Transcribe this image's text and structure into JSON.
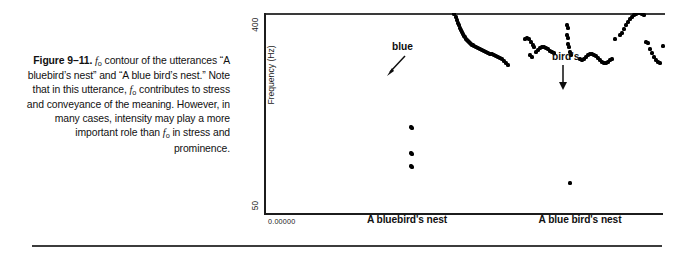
{
  "caption": {
    "figure_label": "Figure 9–11.",
    "text_part_1": " contour of the utterances “A bluebird’s nest” and “A blue bird’s nest.” Note that in this utterance, ",
    "text_part_2": " contributes to stress and conveyance of the meaning. However, in many cases, intensity may play a more important role than ",
    "text_part_3": " in stress and prominence.",
    "symbol": "f",
    "symbol_sub": "o"
  },
  "chart_data": {
    "type": "scatter",
    "title": "",
    "xlabel": "",
    "ylabel": "Frequency (Hz)",
    "ylim": [
      50,
      400
    ],
    "yticks": [
      50,
      400
    ],
    "ytick_labels": [
      "50",
      "400"
    ],
    "y_scale": "logarithmic",
    "grid": false,
    "legend": false,
    "x_origin_label": "0.00000",
    "xtick_labels": [
      "A bluebird's nest",
      "A blue bird's nest"
    ],
    "annotations": [
      {
        "label": "blue",
        "arrow": "diagonal-down-left"
      },
      {
        "label": "bird's",
        "arrow": "vertical-down"
      }
    ],
    "series": [
      {
        "name": "A bluebird's nest",
        "points": [
          [
            101,
            228
          ],
          [
            103,
            228
          ],
          [
            105,
            227
          ],
          [
            107,
            226
          ],
          [
            109,
            226
          ],
          [
            111,
            227
          ],
          [
            113,
            227
          ],
          [
            126,
            232
          ],
          [
            128,
            233
          ],
          [
            130,
            232
          ],
          [
            131,
            230
          ],
          [
            133,
            236
          ],
          [
            135,
            240
          ],
          [
            136,
            243
          ],
          [
            139,
            262
          ],
          [
            141,
            268
          ],
          [
            142,
            272
          ],
          [
            144,
            276
          ],
          [
            146,
            279
          ],
          [
            147,
            281
          ],
          [
            149,
            284
          ],
          [
            151,
            286
          ],
          [
            152,
            287
          ],
          [
            146,
            253
          ],
          [
            148,
            252
          ],
          [
            152,
            258
          ],
          [
            154,
            259
          ],
          [
            156,
            288
          ],
          [
            158,
            287
          ],
          [
            160,
            285
          ],
          [
            157,
            246
          ],
          [
            159,
            245
          ],
          [
            161,
            244
          ],
          [
            163,
            243
          ],
          [
            165,
            242
          ],
          [
            167,
            241
          ],
          [
            168,
            241
          ],
          [
            163,
            262
          ],
          [
            165,
            259
          ],
          [
            166,
            256
          ],
          [
            170,
            239
          ],
          [
            172,
            237
          ],
          [
            173,
            236
          ],
          [
            175,
            233
          ],
          [
            177,
            230
          ],
          [
            178,
            228
          ],
          [
            180,
            224
          ],
          [
            182,
            220
          ],
          [
            183,
            217
          ],
          [
            185,
            213
          ],
          [
            186,
            210
          ],
          [
            188,
            207
          ],
          [
            189,
            204
          ],
          [
            190,
            201
          ],
          [
            192,
            198
          ],
          [
            193,
            195
          ],
          [
            194,
            192
          ],
          [
            195,
            190
          ],
          [
            196,
            187
          ],
          [
            197,
            185
          ],
          [
            198,
            183
          ],
          [
            199,
            181
          ],
          [
            200,
            179
          ],
          [
            201,
            178
          ],
          [
            202,
            176
          ],
          [
            203,
            175
          ],
          [
            204,
            174
          ],
          [
            205,
            173
          ],
          [
            206,
            172
          ],
          [
            207,
            171
          ],
          [
            208,
            170
          ],
          [
            209,
            170
          ],
          [
            210,
            169
          ],
          [
            212,
            168
          ],
          [
            214,
            167
          ],
          [
            216,
            166
          ],
          [
            218,
            165
          ],
          [
            220,
            164
          ],
          [
            222,
            163
          ],
          [
            224,
            162
          ],
          [
            226,
            161
          ],
          [
            228,
            161
          ],
          [
            230,
            160
          ],
          [
            232,
            159
          ],
          [
            234,
            158
          ],
          [
            236,
            157
          ],
          [
            238,
            156
          ],
          [
            240,
            154
          ],
          [
            242,
            152
          ],
          [
            244,
            150
          ],
          [
            147,
            88
          ],
          [
            148,
            87
          ],
          [
            147,
            62
          ],
          [
            148,
            61
          ],
          [
            147,
            49
          ],
          [
            148,
            48
          ]
        ]
      },
      {
        "name": "A blue bird's nest",
        "points": [
          [
            261,
            176
          ],
          [
            263,
            177
          ],
          [
            265,
            176
          ],
          [
            267,
            173
          ],
          [
            269,
            170
          ],
          [
            270,
            168
          ],
          [
            266,
            160
          ],
          [
            268,
            158
          ],
          [
            272,
            163
          ],
          [
            274,
            165
          ],
          [
            276,
            167
          ],
          [
            278,
            168
          ],
          [
            280,
            168
          ],
          [
            282,
            167
          ],
          [
            284,
            166
          ],
          [
            286,
            164
          ],
          [
            288,
            163
          ],
          [
            290,
            162
          ],
          [
            296,
            205
          ],
          [
            303,
            190
          ],
          [
            304,
            187
          ],
          [
            303,
            180
          ],
          [
            304,
            177
          ],
          [
            304,
            171
          ],
          [
            305,
            168
          ],
          [
            306,
            163
          ],
          [
            307,
            160
          ],
          [
            316,
            156
          ],
          [
            318,
            155
          ],
          [
            320,
            156
          ],
          [
            322,
            158
          ],
          [
            324,
            160
          ],
          [
            326,
            161
          ],
          [
            328,
            161
          ],
          [
            330,
            160
          ],
          [
            332,
            159
          ],
          [
            334,
            157
          ],
          [
            336,
            155
          ],
          [
            338,
            153
          ],
          [
            340,
            152
          ],
          [
            342,
            152
          ],
          [
            344,
            153
          ],
          [
            346,
            155
          ],
          [
            348,
            156
          ],
          [
            351,
            176
          ],
          [
            356,
            180
          ],
          [
            358,
            182
          ],
          [
            360,
            186
          ],
          [
            362,
            190
          ],
          [
            364,
            193
          ],
          [
            366,
            196
          ],
          [
            368,
            198
          ],
          [
            370,
            200
          ],
          [
            372,
            201
          ],
          [
            374,
            202
          ],
          [
            376,
            202
          ],
          [
            378,
            201
          ],
          [
            380,
            200
          ],
          [
            365,
            208
          ],
          [
            367,
            209
          ],
          [
            382,
            173
          ],
          [
            384,
            172
          ],
          [
            386,
            166
          ],
          [
            388,
            162
          ],
          [
            390,
            158
          ],
          [
            392,
            155
          ],
          [
            394,
            153
          ],
          [
            396,
            152
          ],
          [
            399,
            169
          ],
          [
            404,
            161
          ],
          [
            406,
            158
          ],
          [
            412,
            171
          ],
          [
            414,
            170
          ],
          [
            416,
            164
          ],
          [
            418,
            160
          ],
          [
            420,
            156
          ],
          [
            422,
            153
          ],
          [
            424,
            151
          ],
          [
            426,
            150
          ],
          [
            428,
            151
          ],
          [
            430,
            153
          ],
          [
            306,
            32
          ]
        ]
      }
    ]
  }
}
